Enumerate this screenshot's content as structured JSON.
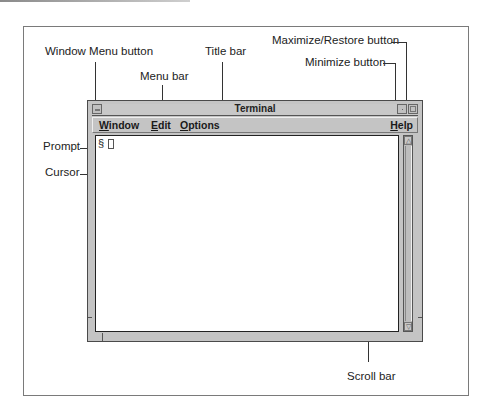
{
  "callouts": {
    "window_menu_button": "Window Menu button",
    "title_bar": "Title bar",
    "menu_bar": "Menu bar",
    "maximize_restore_button": "Maximize/Restore button",
    "minimize_button": "Minimize button",
    "prompt": "Prompt",
    "cursor": "Cursor",
    "scroll_bar": "Scroll bar"
  },
  "window": {
    "title": "Terminal",
    "menus": [
      {
        "mnemonic": "W",
        "rest": "indow"
      },
      {
        "mnemonic": "E",
        "rest": "dit"
      },
      {
        "mnemonic": "O",
        "rest": "ptions"
      },
      {
        "mnemonic": "H",
        "rest": "elp"
      }
    ],
    "prompt_symbol": "§",
    "scroll_up_glyph": "△",
    "scroll_down_glyph": "▽"
  }
}
